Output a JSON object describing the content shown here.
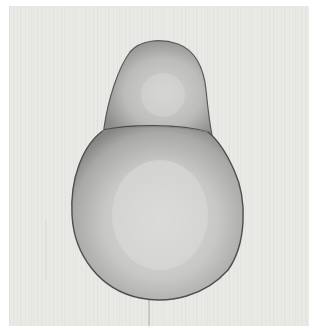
{
  "image": {
    "subject": "pencil drawing of a pear",
    "colors": {
      "border": "#ffffff",
      "paper": "#e9e9e6",
      "pear_light": "#d8d8d6",
      "pear_mid": "#b8b8b6",
      "pear_dark": "#7e7e7c",
      "outline": "#555555"
    }
  }
}
